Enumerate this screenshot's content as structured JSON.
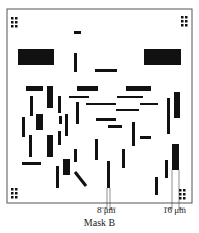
{
  "figure": {
    "caption": "Mask B",
    "background": "#ffffff",
    "ink": "#111111",
    "frame": {
      "x": 7,
      "y": 9,
      "w": 185,
      "h": 194,
      "stroke": "#555555"
    },
    "dimension_labels": [
      {
        "text": "8 μm",
        "x": 99,
        "y": 205
      },
      {
        "text": "16 μm",
        "x": 164,
        "y": 205
      }
    ],
    "alignment_marks": [
      {
        "corner": "top-left",
        "x": 11,
        "y": 17
      },
      {
        "corner": "top-right",
        "x": 181,
        "y": 16
      },
      {
        "corner": "bottom-left",
        "x": 11,
        "y": 188
      },
      {
        "corner": "bottom-right",
        "x": 179,
        "y": 189
      }
    ],
    "rectangles": [
      {
        "x": 74,
        "y": 31,
        "w": 7,
        "h": 3
      },
      {
        "x": 18,
        "y": 49,
        "w": 36,
        "h": 16
      },
      {
        "x": 144,
        "y": 49,
        "w": 37,
        "h": 16
      },
      {
        "x": 74,
        "y": 53,
        "w": 3,
        "h": 19
      },
      {
        "x": 95,
        "y": 69,
        "w": 22,
        "h": 3
      },
      {
        "x": 26,
        "y": 86,
        "w": 17,
        "h": 5
      },
      {
        "x": 47,
        "y": 86,
        "w": 6,
        "h": 22
      },
      {
        "x": 77,
        "y": 86,
        "w": 21,
        "h": 5
      },
      {
        "x": 126,
        "y": 86,
        "w": 25,
        "h": 5
      },
      {
        "x": 30,
        "y": 96,
        "w": 3,
        "h": 20
      },
      {
        "x": 58,
        "y": 96,
        "w": 3,
        "h": 17
      },
      {
        "x": 69,
        "y": 96,
        "w": 20,
        "h": 2
      },
      {
        "x": 117,
        "y": 96,
        "w": 26,
        "h": 2
      },
      {
        "x": 86,
        "y": 103,
        "w": 30,
        "h": 2
      },
      {
        "x": 140,
        "y": 103,
        "w": 18,
        "h": 2
      },
      {
        "x": 76,
        "y": 102,
        "w": 3,
        "h": 22
      },
      {
        "x": 116,
        "y": 109,
        "w": 23,
        "h": 2
      },
      {
        "x": 167,
        "y": 98,
        "w": 3,
        "h": 36
      },
      {
        "x": 174,
        "y": 92,
        "w": 6,
        "h": 26
      },
      {
        "x": 22,
        "y": 117,
        "w": 3,
        "h": 20
      },
      {
        "x": 36,
        "y": 114,
        "w": 7,
        "h": 16
      },
      {
        "x": 59,
        "y": 116,
        "w": 3,
        "h": 8
      },
      {
        "x": 65,
        "y": 114,
        "w": 3,
        "h": 22
      },
      {
        "x": 96,
        "y": 118,
        "w": 20,
        "h": 3
      },
      {
        "x": 108,
        "y": 125,
        "w": 14,
        "h": 3
      },
      {
        "x": 132,
        "y": 122,
        "w": 3,
        "h": 24
      },
      {
        "x": 140,
        "y": 136,
        "w": 11,
        "h": 3
      },
      {
        "x": 29,
        "y": 135,
        "w": 3,
        "h": 22
      },
      {
        "x": 47,
        "y": 135,
        "w": 6,
        "h": 22
      },
      {
        "x": 58,
        "y": 131,
        "w": 3,
        "h": 14
      },
      {
        "x": 95,
        "y": 139,
        "w": 3,
        "h": 21
      },
      {
        "x": 122,
        "y": 149,
        "w": 3,
        "h": 19
      },
      {
        "x": 74,
        "y": 149,
        "w": 3,
        "h": 13
      },
      {
        "x": 22,
        "y": 162,
        "w": 19,
        "h": 3
      },
      {
        "x": 63,
        "y": 159,
        "w": 7,
        "h": 16
      },
      {
        "x": 56,
        "y": 166,
        "w": 3,
        "h": 22
      },
      {
        "x": 107,
        "y": 161,
        "w": 3,
        "h": 27
      },
      {
        "x": 165,
        "y": 160,
        "w": 3,
        "h": 18
      },
      {
        "x": 172,
        "y": 144,
        "w": 7,
        "h": 26
      },
      {
        "x": 155,
        "y": 177,
        "w": 3,
        "h": 18
      }
    ],
    "diagonal_bar": {
      "x1": 75,
      "y1": 172,
      "x2": 86,
      "y2": 186,
      "width": 3
    },
    "dimension_lines": [
      {
        "x1": 107,
        "x2": 110,
        "top": 188,
        "arrow_y": 208
      },
      {
        "x1": 172,
        "x2": 179,
        "top": 170,
        "arrow_y": 208
      }
    ]
  }
}
